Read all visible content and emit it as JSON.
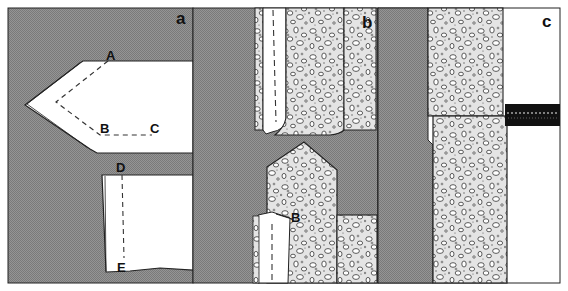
{
  "figure": {
    "panels": [
      {
        "id": "a",
        "label": "a",
        "points": [
          {
            "label": "A"
          },
          {
            "label": "B"
          },
          {
            "label": "C"
          },
          {
            "label": "D"
          },
          {
            "label": "E"
          }
        ]
      },
      {
        "id": "b",
        "label": "b",
        "points": [
          {
            "label": "B"
          }
        ]
      },
      {
        "id": "c",
        "label": "c",
        "points": []
      }
    ],
    "colors": {
      "background_grey": "#8c8c8c",
      "paper_white": "#ffffff",
      "outline": "#1a1a1a",
      "stone_fill": "#e6e6e6",
      "band_black": "#111111"
    }
  }
}
